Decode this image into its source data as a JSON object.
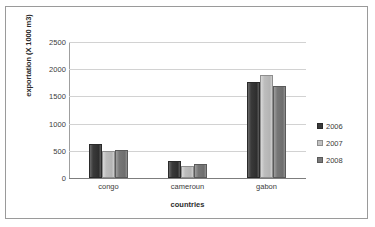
{
  "chart_data": {
    "type": "bar",
    "title": "",
    "xlabel": "countries",
    "ylabel": "exportation (X 1000 m3)",
    "categories": [
      "congo",
      "cameroun",
      "gabon"
    ],
    "series": [
      {
        "name": "2006",
        "values": [
          625,
          310,
          1770
        ],
        "color": "#3a3a3a"
      },
      {
        "name": "2007",
        "values": [
          490,
          225,
          1900
        ],
        "color": "#c2c2c2"
      },
      {
        "name": "2008",
        "values": [
          520,
          250,
          1690
        ],
        "color": "#7a7a7a"
      }
    ],
    "ylim": [
      0,
      2500
    ],
    "yticks": [
      "0",
      "500",
      "1000",
      "1500",
      "2000",
      "2500"
    ],
    "ytick_values": [
      0,
      500,
      1000,
      1500,
      2000,
      2500
    ],
    "grid": true,
    "legend_position": "right"
  }
}
